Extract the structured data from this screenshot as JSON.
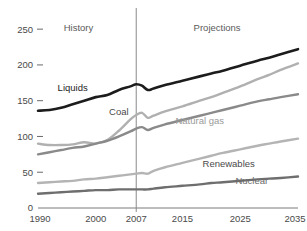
{
  "chart_data": {
    "type": "line",
    "title": "",
    "subtitle": "",
    "xlabel": "",
    "ylabel": "",
    "xlim": [
      1990,
      2035
    ],
    "ylim": [
      0,
      260
    ],
    "grid": false,
    "legend_position": "inline-labels",
    "y_ticks": [
      0,
      50,
      100,
      150,
      200,
      250
    ],
    "y_tick_labels": [
      "0",
      "50",
      "100",
      "150",
      "200",
      "250"
    ],
    "x_ticks": [
      1990,
      2000,
      2007,
      2015,
      2025,
      2035
    ],
    "x_tick_labels": [
      "1990",
      "2000",
      "2007",
      "2015",
      "2025",
      "2035"
    ],
    "annotations": [
      {
        "name": "history",
        "text": "History",
        "x": 1997,
        "y": 248
      },
      {
        "name": "projections",
        "text": "Projections",
        "x": 2021,
        "y": 248
      }
    ],
    "divider": {
      "x": 2007,
      "label": "history-projections-divider"
    },
    "x": [
      1990,
      1992,
      1994,
      1996,
      1998,
      2000,
      2002,
      2004,
      2006,
      2007,
      2008,
      2009,
      2010,
      2012,
      2015,
      2018,
      2020,
      2022,
      2025,
      2028,
      2030,
      2032,
      2035
    ],
    "series": [
      {
        "name": "Liquids",
        "color": "#1c1c1c",
        "width": 2.6,
        "label_x": 1996,
        "label_y": 163,
        "label_color": "#1c1c1c",
        "values": [
          136,
          137,
          140,
          145,
          150,
          155,
          158,
          165,
          170,
          173,
          171,
          165,
          167,
          172,
          178,
          184,
          188,
          192,
          199,
          206,
          210,
          215,
          222
        ]
      },
      {
        "name": "Coal",
        "color": "#b0b0b0",
        "width": 2.4,
        "label_x": 2004,
        "label_y": 130,
        "label_color": "#4a4a4a",
        "values": [
          90,
          88,
          88,
          89,
          92,
          90,
          95,
          108,
          124,
          130,
          133,
          126,
          129,
          135,
          142,
          150,
          155,
          161,
          170,
          180,
          186,
          193,
          202
        ]
      },
      {
        "name": "Natural gas",
        "color": "#8a8a8a",
        "width": 2.4,
        "label_x": 2018,
        "label_y": 117,
        "label_color": "#9a9a9a",
        "values": [
          75,
          78,
          81,
          84,
          86,
          90,
          94,
          100,
          107,
          111,
          113,
          109,
          112,
          117,
          123,
          129,
          133,
          137,
          143,
          149,
          152,
          155,
          159
        ]
      },
      {
        "name": "Renewables",
        "color": "#b4b4b4",
        "width": 2.4,
        "label_x": 2023,
        "label_y": 57,
        "label_color": "#4a4a4a",
        "values": [
          35,
          36,
          37,
          38,
          40,
          41,
          43,
          45,
          47,
          48,
          49,
          48,
          52,
          57,
          63,
          69,
          73,
          77,
          82,
          87,
          90,
          93,
          97
        ]
      },
      {
        "name": "Nuclear",
        "color": "#6e6e6e",
        "width": 2.4,
        "label_x": 2027,
        "label_y": 33,
        "label_color": "#6a6a6a",
        "values": [
          20,
          21,
          22,
          23,
          24,
          25,
          25,
          26,
          26,
          26,
          26,
          26,
          27,
          29,
          31,
          33,
          35,
          36,
          38,
          40,
          41,
          42,
          44
        ]
      }
    ]
  }
}
